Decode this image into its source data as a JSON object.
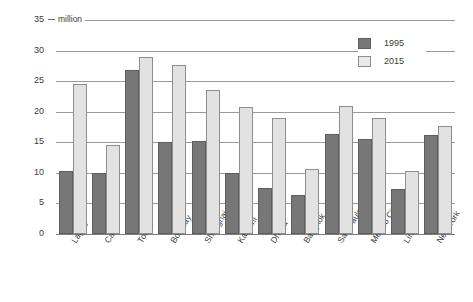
{
  "chart_data": {
    "type": "bar",
    "title": "",
    "subtitle": "",
    "unit_label": "million",
    "xlabel": "",
    "ylabel": "",
    "ylim": [
      0,
      35
    ],
    "yticks": [
      0,
      5,
      10,
      15,
      20,
      25,
      30,
      35
    ],
    "grid": true,
    "legend_position": "top-right",
    "categories": [
      "Lagos",
      "Cairo",
      "Tokyo",
      "Bombay",
      "Shanghai",
      "Karachi",
      "Dhaka",
      "Bangkok",
      "Sao Paulo",
      "Mexico City",
      "Lima",
      "New York"
    ],
    "series": [
      {
        "name": "1995",
        "color": "#777777",
        "values": [
          10.3,
          9.9,
          26.9,
          15.1,
          15.2,
          9.9,
          7.5,
          6.4,
          16.3,
          15.5,
          7.3,
          16.2
        ]
      },
      {
        "name": "2015",
        "color": "#e2e2e2",
        "values": [
          24.6,
          14.5,
          28.9,
          27.7,
          23.6,
          20.7,
          19.0,
          10.6,
          21.0,
          18.9,
          10.3,
          17.6
        ]
      }
    ]
  },
  "legend": {
    "entries": [
      {
        "label": "1995"
      },
      {
        "label": "2015"
      }
    ]
  },
  "axis": {
    "y_tick_labels": [
      "35",
      "30",
      "25",
      "20",
      "15",
      "10",
      "5",
      "0"
    ],
    "unit_caption": "million"
  },
  "colors": {
    "series_1995": "#777777",
    "series_2015": "#e2e2e2",
    "gridline": "#9a9a9a",
    "text": "#3c3c3c",
    "background": "#ffffff"
  }
}
